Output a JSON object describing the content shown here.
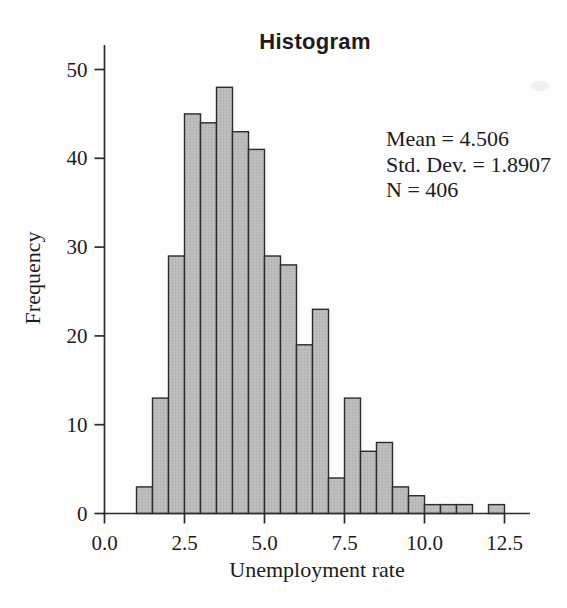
{
  "chart_data": {
    "type": "bar",
    "subtype": "histogram",
    "title": "Histogram",
    "xlabel": "Unemployment rate",
    "ylabel": "Frequency",
    "bin_width": 0.5,
    "bin_edges": [
      1.0,
      1.5,
      2.0,
      2.5,
      3.0,
      3.5,
      4.0,
      4.5,
      5.0,
      5.5,
      6.0,
      6.5,
      7.0,
      7.5,
      8.0,
      8.5,
      9.0,
      9.5,
      10.0,
      10.5,
      11.0,
      11.5,
      12.0,
      12.5
    ],
    "frequencies": [
      3,
      13,
      29,
      45,
      44,
      48,
      43,
      41,
      29,
      28,
      19,
      23,
      4,
      13,
      7,
      8,
      3,
      2,
      1,
      1,
      1,
      0,
      1
    ],
    "x_ticks": [
      0,
      2.5,
      5,
      7.5,
      10,
      12.5
    ],
    "x_tick_labels": [
      "0.0",
      "2.5",
      "5.0",
      "7.5",
      "10.0",
      "12.5"
    ],
    "y_ticks": [
      0,
      10,
      20,
      30,
      40,
      50
    ],
    "y_tick_labels": [
      "0",
      "10",
      "20",
      "30",
      "40",
      "50"
    ],
    "xlim": [
      0,
      13.3
    ],
    "ylim": [
      0,
      52.8
    ],
    "grid": false,
    "legend": "none",
    "annotations": [
      "Mean = 4.506",
      "Std. Dev. = 1.8907",
      "N = 406"
    ],
    "stats": {
      "mean": "4.506",
      "std_dev": "1.8907",
      "n": "406"
    },
    "colors": {
      "bar_fill": "#bdbdbd",
      "bar_dot": "#a9a9a9",
      "bar_stroke": "#2b2b2b",
      "axis": "#2b2b2b",
      "text": "#1c1c1c",
      "background": "#fdfdfd"
    }
  }
}
